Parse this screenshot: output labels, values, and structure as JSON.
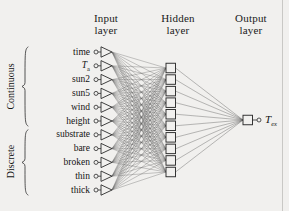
{
  "figure": {
    "type": "neural-network-diagram",
    "background_color": "#f1f0ee",
    "line_color": "#3a3a3a",
    "text_color": "#131313"
  },
  "headers": [
    {
      "name": "input-layer-header",
      "line1": "Input",
      "line2": "layer"
    },
    {
      "name": "hidden-layer-header",
      "line1": "Hidden",
      "line2": "layer"
    },
    {
      "name": "output-layer-header",
      "line1": "Output",
      "line2": "layer"
    }
  ],
  "groups": [
    {
      "name": "continuous-group",
      "label": "Continuous",
      "count": 6
    },
    {
      "name": "discrete-group",
      "label": "Discrete",
      "count": 5
    }
  ],
  "input_layer": {
    "count": 11,
    "nodes": [
      {
        "label": "time",
        "sub": "",
        "group": "Continuous"
      },
      {
        "label": "T",
        "sub": "a",
        "group": "Continuous"
      },
      {
        "label": "sun2",
        "sub": "",
        "group": "Continuous"
      },
      {
        "label": "sun5",
        "sub": "",
        "group": "Continuous"
      },
      {
        "label": "wind",
        "sub": "",
        "group": "Continuous"
      },
      {
        "label": "height",
        "sub": "",
        "group": "Continuous"
      },
      {
        "label": "substrate",
        "sub": "",
        "group": "Discrete"
      },
      {
        "label": "bare",
        "sub": "",
        "group": "Discrete"
      },
      {
        "label": "broken",
        "sub": "",
        "group": "Discrete"
      },
      {
        "label": "thin",
        "sub": "",
        "group": "Discrete"
      },
      {
        "label": "thick",
        "sub": "",
        "group": "Discrete"
      }
    ]
  },
  "hidden_layer": {
    "count": 10
  },
  "output_layer": {
    "count": 1,
    "label": "T",
    "sub": "ex"
  },
  "chart_data": {
    "type": "diagram",
    "title": "",
    "layers": [
      {
        "name": "Input layer",
        "units": 11,
        "unit_labels": [
          "time",
          "Ta",
          "sun2",
          "sun5",
          "wind",
          "height",
          "substrate",
          "bare",
          "broken",
          "thin",
          "thick"
        ]
      },
      {
        "name": "Hidden layer",
        "units": 10,
        "unit_labels": []
      },
      {
        "name": "Output layer",
        "units": 1,
        "unit_labels": [
          "Tex"
        ]
      }
    ],
    "connections": [
      {
        "from": "Input layer",
        "to": "Hidden layer",
        "style": "fully-connected",
        "edges": 110
      },
      {
        "from": "Hidden layer",
        "to": "Output layer",
        "style": "fully-connected",
        "edges": 10
      }
    ]
  }
}
